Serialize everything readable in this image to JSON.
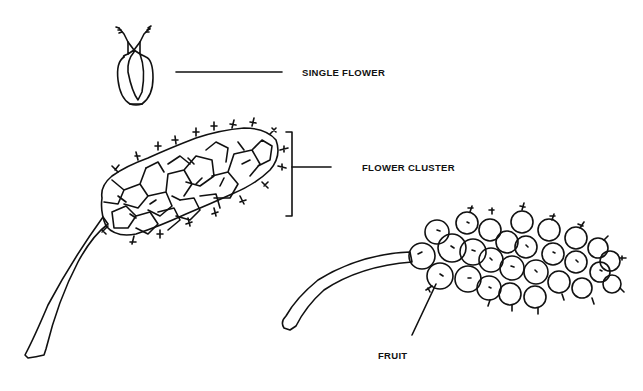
{
  "diagram": {
    "labels": {
      "single_flower": "SINGLE FLOWER",
      "flower_cluster": "FLOWER CLUSTER",
      "fruit": "FRUIT"
    },
    "colors": {
      "line": "#111111",
      "background": "#ffffff"
    }
  }
}
